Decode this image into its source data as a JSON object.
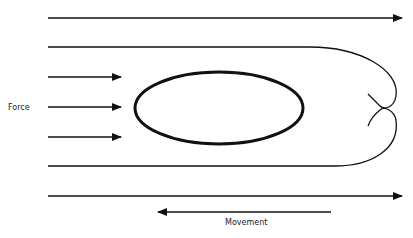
{
  "diagram": {
    "labels": {
      "force": "Force",
      "movement": "Movement"
    },
    "elements": {
      "flow_lines": [
        "top-flow-arrow",
        "upper-wrap-line",
        "lower-wrap-line",
        "bottom-flow-arrow"
      ],
      "force_arrows": 3,
      "body_shape": "ellipse",
      "wake": "vortex-curl"
    },
    "colors": {
      "stroke": "#111111",
      "background": "#ffffff"
    }
  }
}
